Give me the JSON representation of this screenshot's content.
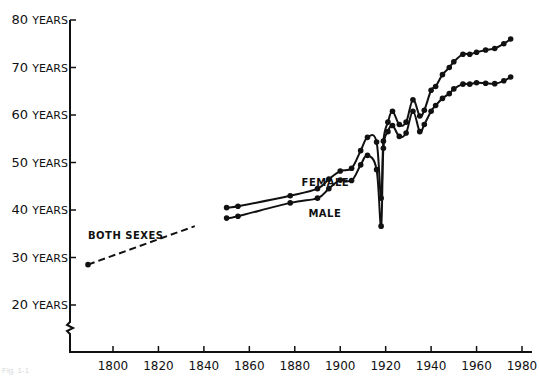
{
  "chart_data": {
    "type": "line",
    "title": "",
    "xlabel": "",
    "ylabel": "",
    "xlim": [
      1781,
      1982
    ],
    "ylim": [
      15,
      80
    ],
    "grid": false,
    "legend": "inline labels",
    "x_ticks": [
      1800,
      1820,
      1840,
      1860,
      1880,
      1900,
      1920,
      1940,
      1960,
      1980
    ],
    "y_ticks": [
      {
        "value": 80,
        "label": "80 YEARS"
      },
      {
        "value": 70,
        "label": "70 YEARS"
      },
      {
        "value": 60,
        "label": "60 YEARS"
      },
      {
        "value": 50,
        "label": "50 YEARS"
      },
      {
        "value": 40,
        "label": "40 YEARS"
      },
      {
        "value": 30,
        "label": "30 YEARS"
      },
      {
        "value": 20,
        "label": "20 YEARS"
      }
    ],
    "y_axis_break": true,
    "annotations": [
      {
        "text": "FEMALE",
        "x": 1883,
        "y": 45
      },
      {
        "text": "MALE",
        "x": 1886,
        "y": 38.5
      },
      {
        "text": "BOTH SEXES",
        "x": 1789,
        "y": 34
      }
    ],
    "series": [
      {
        "name": "BOTH SEXES",
        "style": "dashed",
        "points": [
          [
            1789,
            28.5
          ],
          [
            1836,
            36.6
          ]
        ],
        "markers": [
          [
            1789,
            28.5
          ]
        ]
      },
      {
        "name": "FEMALE",
        "style": "solid",
        "points": [
          [
            1850,
            40.5
          ],
          [
            1855,
            40.8
          ],
          [
            1878,
            43.0
          ],
          [
            1890,
            44.5
          ],
          [
            1895,
            46.5
          ],
          [
            1900,
            48.2
          ],
          [
            1905,
            48.8
          ],
          [
            1909,
            52.5
          ],
          [
            1912,
            55.3
          ],
          [
            1916,
            54.3
          ],
          [
            1918,
            42.5
          ],
          [
            1919,
            54.5
          ],
          [
            1921,
            58.5
          ],
          [
            1923,
            60.8
          ],
          [
            1926,
            58.0
          ],
          [
            1929,
            58.5
          ],
          [
            1932,
            63.2
          ],
          [
            1935,
            59.8
          ],
          [
            1937,
            61.0
          ],
          [
            1940,
            65.2
          ],
          [
            1942,
            66.0
          ],
          [
            1945,
            68.5
          ],
          [
            1948,
            70.0
          ],
          [
            1950,
            71.2
          ],
          [
            1954,
            72.8
          ],
          [
            1957,
            72.8
          ],
          [
            1960,
            73.2
          ],
          [
            1964,
            73.7
          ],
          [
            1968,
            74.0
          ],
          [
            1972,
            75.0
          ],
          [
            1975,
            76.0
          ]
        ]
      },
      {
        "name": "MALE",
        "style": "solid",
        "points": [
          [
            1850,
            38.3
          ],
          [
            1855,
            38.7
          ],
          [
            1878,
            41.5
          ],
          [
            1890,
            42.5
          ],
          [
            1895,
            44.5
          ],
          [
            1900,
            46.3
          ],
          [
            1905,
            46.2
          ],
          [
            1909,
            49.5
          ],
          [
            1912,
            51.5
          ],
          [
            1916,
            48.5
          ],
          [
            1918,
            36.6
          ],
          [
            1919,
            53.0
          ],
          [
            1921,
            56.5
          ],
          [
            1923,
            57.8
          ],
          [
            1926,
            55.5
          ],
          [
            1929,
            56.2
          ],
          [
            1932,
            60.8
          ],
          [
            1935,
            56.5
          ],
          [
            1937,
            58.0
          ],
          [
            1940,
            60.8
          ],
          [
            1942,
            62.0
          ],
          [
            1945,
            63.5
          ],
          [
            1948,
            64.5
          ],
          [
            1950,
            65.5
          ],
          [
            1954,
            66.5
          ],
          [
            1957,
            66.5
          ],
          [
            1960,
            66.8
          ],
          [
            1964,
            66.7
          ],
          [
            1968,
            66.6
          ],
          [
            1972,
            67.2
          ],
          [
            1975,
            68.0
          ]
        ]
      }
    ]
  },
  "caption": "Fig. 1-1"
}
